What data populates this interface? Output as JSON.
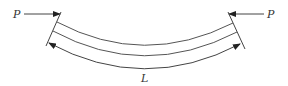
{
  "diagram": {
    "title": "",
    "labels": {
      "load_left": "P",
      "load_right": "P",
      "length": "L"
    },
    "colors": {
      "stroke": "#444444",
      "text": "#333333",
      "background": "#ffffff"
    }
  }
}
